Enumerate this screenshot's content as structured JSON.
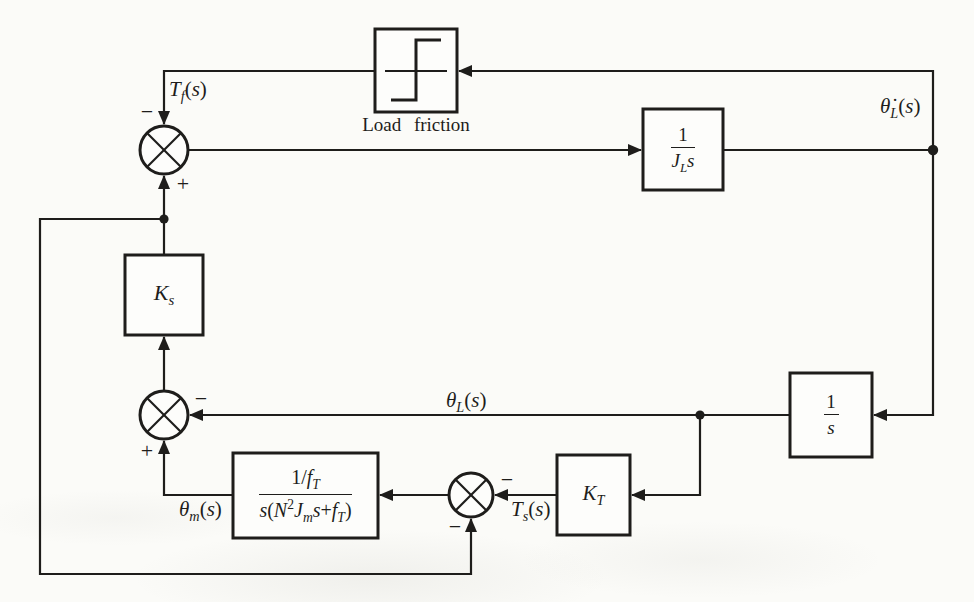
{
  "figure": {
    "type": "control-system-block-diagram",
    "colors": {
      "line": "#1e1d1b",
      "background": "#fbfbf8",
      "box_fill": "#fdfdfb"
    },
    "labels": {
      "load_friction": "Load friction",
      "tf": "T_{f}(s)",
      "theta_l_dot": "θ̇_{L}(s)",
      "theta_l": "θ_{L}(s)",
      "theta_m": "θ_{m}(s)",
      "ts": "T_{s}(s)"
    },
    "signs": {
      "j1_top": "−",
      "j1_bottom": "+",
      "j2_right": "−",
      "j2_bottom": "+",
      "j3_right": "−",
      "j3_bottom": "−"
    },
    "blocks": {
      "load_friction_nonlinearity": {
        "symbol": "relay-step"
      },
      "load_inertia": {
        "num": "1",
        "den": "J_{L}s"
      },
      "gain_ks": "K_{s}",
      "integrator": {
        "num": "1",
        "den": "s"
      },
      "gain_kt": "K_{T}",
      "motor_geartrain": {
        "num": "1/f_{T}",
        "den": "s(N^{2}J_{m}s+f_{T})"
      }
    }
  }
}
